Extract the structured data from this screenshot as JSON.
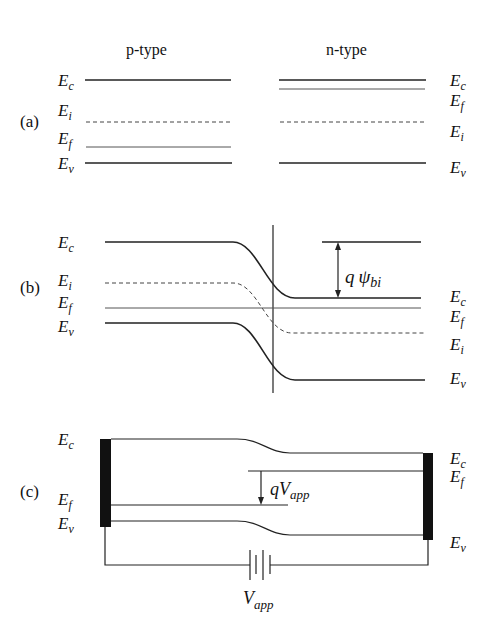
{
  "figure": {
    "panels": [
      {
        "id": "a",
        "label": "(a)",
        "headers": {
          "p_side": "p-type",
          "n_side": "n-type"
        },
        "p_side_levels": [
          {
            "name": "E",
            "sub": "c",
            "kind": "conduction"
          },
          {
            "name": "E",
            "sub": "i",
            "kind": "intrinsic"
          },
          {
            "name": "E",
            "sub": "f",
            "kind": "fermi"
          },
          {
            "name": "E",
            "sub": "v",
            "kind": "valence"
          }
        ],
        "n_side_levels": [
          {
            "name": "E",
            "sub": "c",
            "kind": "conduction"
          },
          {
            "name": "E",
            "sub": "f",
            "kind": "fermi"
          },
          {
            "name": "E",
            "sub": "i",
            "kind": "intrinsic"
          },
          {
            "name": "E",
            "sub": "v",
            "kind": "valence"
          }
        ]
      },
      {
        "id": "b",
        "label": "(b)",
        "left_levels": [
          {
            "name": "E",
            "sub": "c"
          },
          {
            "name": "E",
            "sub": "i"
          },
          {
            "name": "E",
            "sub": "f"
          },
          {
            "name": "E",
            "sub": "v"
          }
        ],
        "right_levels": [
          {
            "name": "E",
            "sub": "c"
          },
          {
            "name": "E",
            "sub": "f"
          },
          {
            "name": "E",
            "sub": "i"
          },
          {
            "name": "E",
            "sub": "v"
          }
        ],
        "annotation": {
          "prefix": "q",
          "symbol": "ψ",
          "sub": "bi"
        }
      },
      {
        "id": "c",
        "label": "(c)",
        "left_levels": [
          {
            "name": "E",
            "sub": "c"
          },
          {
            "name": "E",
            "sub": "f"
          },
          {
            "name": "E",
            "sub": "v"
          }
        ],
        "right_levels": [
          {
            "name": "E",
            "sub": "c"
          },
          {
            "name": "E",
            "sub": "f"
          },
          {
            "name": "E",
            "sub": "v"
          }
        ],
        "annotation": {
          "prefix": "qV",
          "sub": "app"
        },
        "battery_label": {
          "main": "V",
          "sub": "app"
        }
      }
    ]
  }
}
